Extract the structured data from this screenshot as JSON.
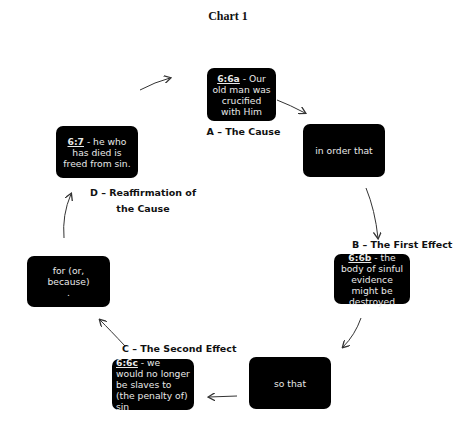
{
  "title": "Chart 1",
  "nodes": {
    "a": {
      "ref": "6:6a",
      "text": " - Our old man was crucified with Him",
      "label": "A – The Cause"
    },
    "in_order_that": {
      "text": "in order that"
    },
    "b": {
      "ref": "6:6b",
      "text": " - the body of sinful evidence might be destroyed",
      "label": "B – The First Effect"
    },
    "so_that": {
      "text": "so that"
    },
    "c": {
      "ref": "6:6c",
      "text": " - we would no longer be slaves to (the penalty of) sin",
      "label": "C – The Second Effect"
    },
    "for_because": {
      "text": "for (or, because)",
      "dot": "."
    },
    "d": {
      "ref": "6:7",
      "text": " - he who has died is freed from sin.",
      "label_line1": "D – Reaffirmation of",
      "label_line2": "the Cause"
    }
  },
  "colors": {
    "box_bg": "#000000",
    "box_text": "#e8e8e8",
    "arrow": "#333333"
  }
}
